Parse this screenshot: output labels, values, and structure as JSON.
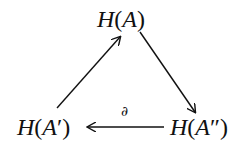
{
  "diagram": {
    "nodes": {
      "top": {
        "func": "H",
        "open": "(",
        "arg": "A",
        "prime": "",
        "close": ")"
      },
      "left": {
        "func": "H",
        "open": "(",
        "arg": "A",
        "prime": "′",
        "close": ")"
      },
      "right": {
        "func": "H",
        "open": "(",
        "arg": "A",
        "prime": "″",
        "close": ")"
      }
    },
    "edges": [
      {
        "from": "left",
        "to": "top",
        "label": ""
      },
      {
        "from": "top",
        "to": "right",
        "label": ""
      },
      {
        "from": "right",
        "to": "left",
        "label": "∂"
      }
    ],
    "stroke_color": "#111111"
  }
}
